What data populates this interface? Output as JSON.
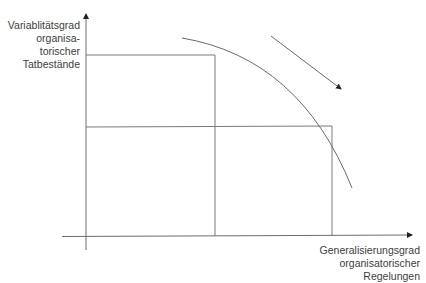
{
  "diagram": {
    "y_axis_label": {
      "line1": "Variablitätsgrad",
      "line2": "organisa-",
      "line3": "torischer",
      "line4": "Tatbestände"
    },
    "x_axis_label": {
      "line1": "Generalisierungsgrad",
      "line2": "organisatorischer",
      "line3": "Regelungen"
    },
    "colors": {
      "axis": "#6e6e6e",
      "lines": "#7a7a7a",
      "text": "#404040",
      "background": "#ffffff"
    },
    "elements": {
      "y_axis": {
        "x": 86,
        "y_top": 12,
        "y_bottom": 250
      },
      "x_axis": {
        "y": 236,
        "x_left": 62,
        "x_right": 415
      },
      "rectangle_1": {
        "top_y": 55,
        "right_x": 215
      },
      "rectangle_2": {
        "top_y": 126,
        "right_x": 332
      },
      "curve": {
        "start": [
          182,
          38
        ],
        "end": [
          352,
          188
        ]
      },
      "direction_arrow": {
        "start": [
          271,
          36
        ],
        "end": [
          342,
          90
        ]
      }
    }
  }
}
